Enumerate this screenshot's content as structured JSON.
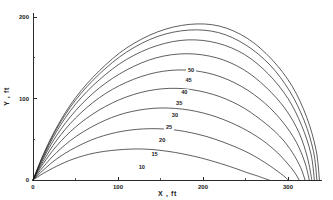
{
  "chart_data": {
    "type": "line",
    "title": "",
    "xlabel": "X , ft",
    "ylabel": "Y , ft",
    "xlim": [
      0,
      340
    ],
    "ylim": [
      0,
      205
    ],
    "grid": false,
    "legend_position": "inline-curve-labels",
    "x_ticks_major": [
      0,
      100,
      200,
      300
    ],
    "x_tick_labels": [
      "0",
      "100",
      "200",
      "300"
    ],
    "x_ticks_minor": [
      50,
      150,
      250
    ],
    "y_ticks_major": [
      0,
      100,
      200
    ],
    "y_tick_labels": [
      "0",
      "100",
      "200"
    ],
    "y_ticks_minor": [
      50,
      150
    ],
    "series": [
      {
        "name": "10",
        "label": "10",
        "label_x": 128,
        "label_y": 14,
        "x": [
          0,
          12,
          28,
          48,
          72,
          100,
          130,
          160,
          190,
          215,
          236,
          252,
          264,
          272,
          278
        ],
        "y": [
          0,
          8,
          17,
          26,
          33,
          37,
          38,
          35,
          29,
          22,
          15,
          9,
          5,
          2,
          0
        ]
      },
      {
        "name": "15",
        "label": "15",
        "label_x": 143,
        "label_y": 30,
        "x": [
          0,
          12,
          28,
          50,
          76,
          106,
          138,
          170,
          202,
          230,
          254,
          272,
          286,
          295,
          300
        ],
        "y": [
          0,
          12,
          26,
          40,
          52,
          60,
          63,
          61,
          54,
          44,
          33,
          22,
          12,
          5,
          0
        ]
      },
      {
        "name": "20",
        "label": "20",
        "label_x": 152,
        "label_y": 47,
        "x": [
          0,
          12,
          28,
          50,
          78,
          108,
          142,
          176,
          208,
          238,
          264,
          284,
          298,
          308,
          313
        ],
        "y": [
          0,
          16,
          34,
          53,
          70,
          82,
          88,
          87,
          80,
          68,
          53,
          37,
          22,
          9,
          0
        ]
      },
      {
        "name": "25",
        "label": "25",
        "label_x": 160,
        "label_y": 62,
        "x": [
          0,
          12,
          28,
          50,
          78,
          110,
          144,
          178,
          212,
          242,
          268,
          290,
          305,
          315,
          320
        ],
        "y": [
          0,
          20,
          42,
          65,
          86,
          102,
          111,
          112,
          105,
          92,
          74,
          54,
          34,
          15,
          0
        ]
      },
      {
        "name": "30",
        "label": "30",
        "label_x": 167,
        "label_y": 77,
        "x": [
          0,
          12,
          28,
          50,
          78,
          110,
          145,
          180,
          214,
          245,
          272,
          294,
          310,
          320,
          325
        ],
        "y": [
          0,
          23,
          49,
          76,
          101,
          120,
          132,
          135,
          129,
          115,
          95,
          71,
          46,
          21,
          0
        ]
      },
      {
        "name": "35",
        "label": "35",
        "label_x": 172,
        "label_y": 92,
        "x": [
          0,
          12,
          28,
          50,
          78,
          110,
          145,
          181,
          216,
          247,
          274,
          297,
          313,
          323,
          328
        ],
        "y": [
          0,
          26,
          55,
          85,
          113,
          135,
          150,
          155,
          150,
          136,
          114,
          87,
          58,
          27,
          0
        ]
      },
      {
        "name": "40",
        "label": "40",
        "label_x": 178,
        "label_y": 106,
        "x": [
          0,
          12,
          28,
          50,
          78,
          110,
          146,
          182,
          217,
          249,
          277,
          300,
          316,
          327,
          331
        ],
        "y": [
          0,
          28,
          60,
          93,
          123,
          148,
          165,
          172,
          168,
          154,
          130,
          100,
          67,
          32,
          0
        ]
      },
      {
        "name": "45",
        "label": "45",
        "label_x": 183,
        "label_y": 120,
        "x": [
          0,
          12,
          28,
          50,
          78,
          110,
          146,
          183,
          218,
          250,
          279,
          302,
          319,
          330,
          334
        ],
        "y": [
          0,
          30,
          63,
          98,
          130,
          157,
          176,
          184,
          181,
          166,
          141,
          109,
          73,
          35,
          0
        ]
      },
      {
        "name": "50",
        "label": "50",
        "label_x": 186,
        "label_y": 132,
        "x": [
          0,
          12,
          28,
          50,
          78,
          110,
          147,
          184,
          219,
          252,
          281,
          305,
          322,
          333,
          337
        ],
        "y": [
          0,
          31,
          65,
          101,
          134,
          162,
          182,
          191,
          189,
          174,
          148,
          115,
          77,
          37,
          0
        ]
      }
    ]
  }
}
